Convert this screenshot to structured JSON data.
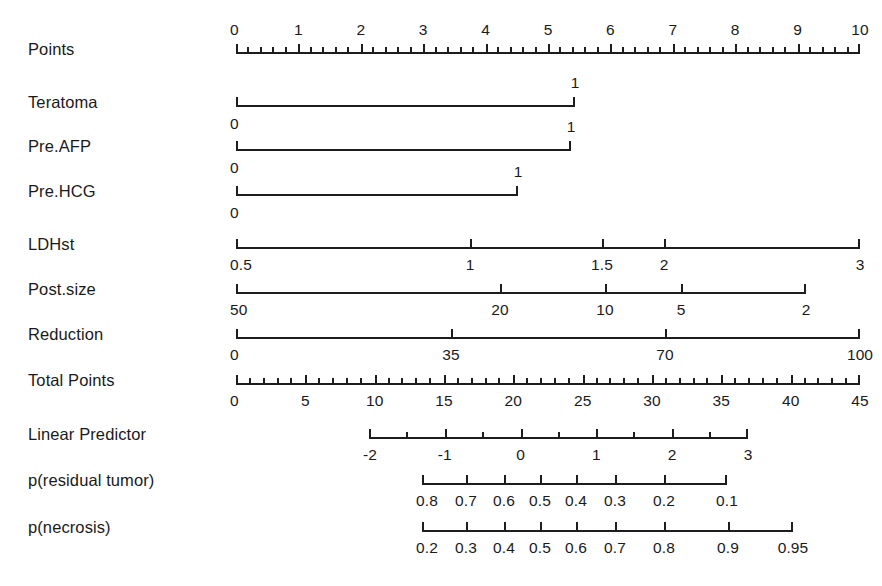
{
  "figure": {
    "type": "nomogram",
    "title": "",
    "background_color": "#ffffff",
    "line_color": "#1d1d1d"
  },
  "chart_data": {
    "type": "table",
    "title": "",
    "xlabel": "",
    "ylabel": "",
    "rows": [
      {
        "label": "Points",
        "axis_start_px": 236,
        "axis_end_px": 860,
        "line_y_px": 52,
        "labels_position": "above",
        "major_ticks": [
          "0",
          "1",
          "2",
          "3",
          "4",
          "5",
          "6",
          "7",
          "8",
          "9",
          "10"
        ],
        "major_values": [
          0,
          1,
          2,
          3,
          4,
          5,
          6,
          7,
          8,
          9,
          10
        ],
        "minor_per_interval": 5,
        "range": [
          0,
          10
        ]
      },
      {
        "label": "Teratoma",
        "axis_start_px": 236,
        "axis_end_px": 575,
        "line_y_px": 105,
        "labels_position": "split",
        "major_ticks": [
          "0",
          "1"
        ],
        "major_values": [
          0,
          1
        ],
        "minor_per_interval": 0,
        "range": [
          0,
          1
        ]
      },
      {
        "label": "Pre.AFP",
        "axis_start_px": 236,
        "axis_end_px": 571,
        "line_y_px": 149,
        "labels_position": "split",
        "major_ticks": [
          "0",
          "1"
        ],
        "major_values": [
          0,
          1
        ],
        "minor_per_interval": 0,
        "range": [
          0,
          1
        ]
      },
      {
        "label": "Pre.HCG",
        "axis_start_px": 236,
        "axis_end_px": 518,
        "line_y_px": 194,
        "labels_position": "split",
        "major_ticks": [
          "0",
          "1"
        ],
        "major_values": [
          0,
          1
        ],
        "minor_per_interval": 0,
        "range": [
          0,
          1
        ]
      },
      {
        "label": "LDHst",
        "axis_start_px": 236,
        "axis_end_px": 860,
        "line_y_px": 247,
        "labels_position": "below",
        "major_ticks": [
          "0.5",
          "1",
          "1.5",
          "2",
          "3"
        ],
        "major_values": [
          0.5,
          1,
          1.5,
          2,
          3
        ],
        "tick_px": [
          236,
          470,
          602,
          664,
          860
        ],
        "minor_per_interval": 0,
        "range": [
          0.5,
          3
        ]
      },
      {
        "label": "Post.size",
        "axis_start_px": 236,
        "axis_end_px": 806,
        "line_y_px": 292,
        "labels_position": "below",
        "major_ticks": [
          "50",
          "20",
          "10",
          "5",
          "2"
        ],
        "major_values": [
          50,
          20,
          10,
          5,
          2
        ],
        "tick_px": [
          236,
          500,
          605,
          681,
          806
        ],
        "minor_per_interval": 0,
        "range": [
          50,
          2
        ]
      },
      {
        "label": "Reduction",
        "axis_start_px": 236,
        "axis_end_px": 860,
        "line_y_px": 337,
        "labels_position": "below",
        "major_ticks": [
          "0",
          "35",
          "70",
          "100"
        ],
        "major_values": [
          0,
          35,
          70,
          100
        ],
        "tick_px": [
          236,
          451,
          665,
          860
        ],
        "minor_per_interval": 0,
        "range": [
          0,
          100
        ]
      },
      {
        "label": "Total Points",
        "axis_start_px": 236,
        "axis_end_px": 860,
        "line_y_px": 383,
        "labels_position": "below",
        "major_ticks": [
          "0",
          "5",
          "10",
          "15",
          "20",
          "25",
          "30",
          "35",
          "40",
          "45"
        ],
        "major_values": [
          0,
          5,
          10,
          15,
          20,
          25,
          30,
          35,
          40,
          45
        ],
        "minor_per_interval": 5,
        "range": [
          0,
          45
        ]
      },
      {
        "label": "Linear Predictor",
        "axis_start_px": 369,
        "axis_end_px": 748,
        "line_y_px": 437,
        "labels_position": "below",
        "major_ticks": [
          "-2",
          "-1",
          "0",
          "1",
          "2",
          "3"
        ],
        "major_values": [
          -2,
          -1,
          0,
          1,
          2,
          3
        ],
        "minor_per_interval": 2,
        "range": [
          -2,
          3
        ]
      },
      {
        "label": "p(residual tumor)",
        "axis_start_px": 422,
        "axis_end_px": 727,
        "line_y_px": 483,
        "labels_position": "below",
        "major_ticks": [
          "0.8",
          "0.7",
          "0.6",
          "0.5",
          "0.4",
          "0.3",
          "0.2",
          "0.1"
        ],
        "major_values": [
          0.8,
          0.7,
          0.6,
          0.5,
          0.4,
          0.3,
          0.2,
          0.1
        ],
        "tick_px": [
          422,
          466,
          504,
          540,
          576,
          615,
          664,
          727
        ],
        "minor_per_interval": 0,
        "range": [
          0.8,
          0.1
        ]
      },
      {
        "label": "p(necrosis)",
        "axis_start_px": 422,
        "axis_end_px": 793,
        "line_y_px": 530,
        "labels_position": "below",
        "major_ticks": [
          "0.2",
          "0.3",
          "0.4",
          "0.5",
          "0.6",
          "0.7",
          "0.8",
          "0.9",
          "0.95"
        ],
        "major_values": [
          0.2,
          0.3,
          0.4,
          0.5,
          0.6,
          0.7,
          0.8,
          0.9,
          0.95
        ],
        "tick_px": [
          422,
          466,
          504,
          540,
          576,
          615,
          664,
          728,
          793
        ],
        "minor_per_interval": 0,
        "range": [
          0.2,
          0.95
        ]
      }
    ]
  },
  "labels": {
    "points": "Points",
    "teratoma": "Teratoma",
    "pre_afp": "Pre.AFP",
    "pre_hcg": "Pre.HCG",
    "ldhst": "LDHst",
    "post_size": "Post.size",
    "reduction": "Reduction",
    "total_points": "Total Points",
    "linear_predictor": "Linear Predictor",
    "p_residual_tumor": "p(residual tumor)",
    "p_necrosis": "p(necrosis)"
  }
}
